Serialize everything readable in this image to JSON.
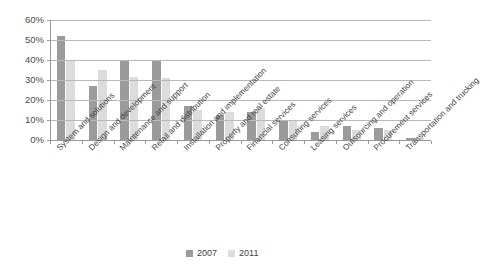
{
  "chart_data": {
    "type": "bar",
    "title": "",
    "subtitle": "",
    "xlabel": "",
    "ylabel": "",
    "ylim": [
      0,
      60
    ],
    "y_ticks": [
      "0%",
      "10%",
      "20%",
      "30%",
      "40%",
      "50%",
      "60%"
    ],
    "y_tick_values": [
      0,
      10,
      20,
      30,
      40,
      50,
      60
    ],
    "grid": true,
    "legend_position": "bottom-center",
    "value_unit": "%",
    "categories": [
      "System and solutions",
      "Design and development",
      "Maintenance and support",
      "Retail and distribution",
      "Installation and implementation",
      "Property and real estate",
      "Financial services",
      "Consulting services",
      "Leasing services",
      "Outsourcing and operation",
      "Procurement services",
      "Transportation and trucking"
    ],
    "series": [
      {
        "name": "2007",
        "color": "#9b9b9b",
        "values": [
          52,
          27,
          40,
          40,
          17,
          12.5,
          14,
          10,
          4,
          7,
          6,
          1
        ]
      },
      {
        "name": "2011",
        "color": "#dcdcdc",
        "values": [
          40,
          35,
          31.5,
          31,
          15,
          14,
          16,
          10,
          7,
          5,
          5,
          1
        ]
      }
    ]
  },
  "legend": {
    "items": [
      {
        "label": "2007",
        "color": "#9b9b9b"
      },
      {
        "label": "2011",
        "color": "#dcdcdc"
      }
    ]
  },
  "colors": {
    "series_2007": "#9b9b9b",
    "series_2011": "#dcdcdc",
    "gridline": "#b9b9b9",
    "axis": "#9a9a9a",
    "background": "#ffffff",
    "text": "#3f3f3f"
  }
}
